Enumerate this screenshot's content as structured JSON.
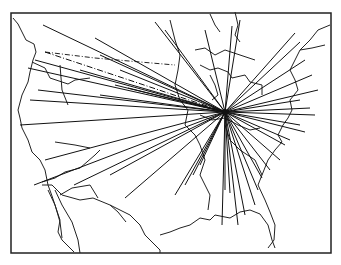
{
  "figure": {
    "type": "hub-and-spoke map",
    "region": "United States",
    "frame": {
      "x": 11,
      "y": 13,
      "width": 320,
      "height": 240
    },
    "hub": {
      "x": 225,
      "y": 112
    },
    "line_color": "#111111",
    "background": "#ffffff",
    "spoke_endpoints": [
      [
        43,
        25
      ],
      [
        95,
        38
      ],
      [
        155,
        22
      ],
      [
        165,
        30
      ],
      [
        205,
        30
      ],
      [
        232,
        26
      ],
      [
        240,
        20
      ],
      [
        295,
        33
      ],
      [
        300,
        42
      ],
      [
        305,
        60
      ],
      [
        312,
        75
      ],
      [
        318,
        90
      ],
      [
        300,
        100
      ],
      [
        310,
        108
      ],
      [
        315,
        115
      ],
      [
        300,
        125
      ],
      [
        305,
        132
      ],
      [
        290,
        140
      ],
      [
        285,
        145
      ],
      [
        280,
        160
      ],
      [
        270,
        170
      ],
      [
        262,
        178
      ],
      [
        258,
        190
      ],
      [
        255,
        205
      ],
      [
        245,
        215
      ],
      [
        238,
        225
      ],
      [
        230,
        193
      ],
      [
        225,
        190
      ],
      [
        222,
        225
      ],
      [
        185,
        185
      ],
      [
        175,
        195
      ],
      [
        193,
        175
      ],
      [
        200,
        165
      ],
      [
        125,
        198
      ],
      [
        110,
        175
      ],
      [
        74,
        185
      ],
      [
        45,
        160
      ],
      [
        34,
        185
      ],
      [
        20,
        125
      ],
      [
        30,
        100
      ],
      [
        38,
        90
      ],
      [
        28,
        68
      ],
      [
        35,
        60
      ],
      [
        80,
        70
      ],
      [
        100,
        55
      ],
      [
        120,
        70
      ],
      [
        115,
        85
      ],
      [
        128,
        88
      ],
      [
        100,
        95
      ]
    ],
    "dashed_spoke": [
      [
        45,
        52
      ],
      [
        225,
        112
      ]
    ]
  }
}
